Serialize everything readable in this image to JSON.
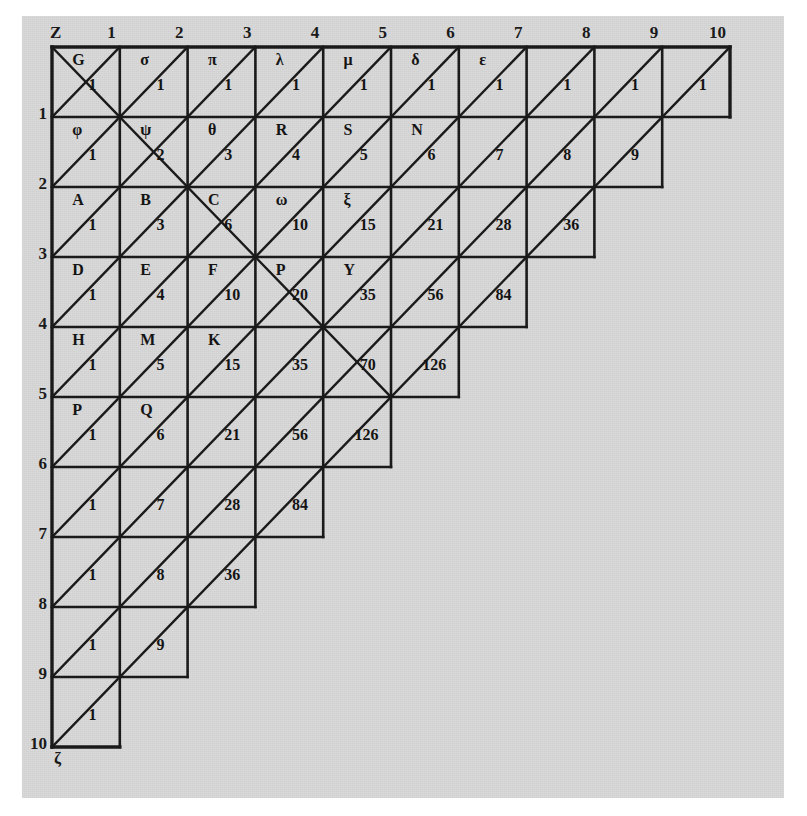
{
  "figure": {
    "kind": "arithmetic-triangle-table",
    "background_color": "#d8d8d8",
    "ink_color": "#1a1a1a",
    "page_color": "#ffffff"
  },
  "axes": {
    "corner_label": "Z",
    "bottom_left_label": "ζ",
    "column_headers": [
      "1",
      "2",
      "3",
      "4",
      "5",
      "6",
      "7",
      "8",
      "9",
      "10"
    ],
    "row_headers": [
      "1",
      "2",
      "3",
      "4",
      "5",
      "6",
      "7",
      "8",
      "9",
      "10"
    ]
  },
  "chart_data": {
    "type": "table",
    "xlabel": "Z",
    "ylabel": "ζ",
    "columns": [
      "1",
      "2",
      "3",
      "4",
      "5",
      "6",
      "7",
      "8",
      "9",
      "10"
    ],
    "rows": [
      "1",
      "2",
      "3",
      "4",
      "5",
      "6",
      "7",
      "8",
      "9",
      "10"
    ],
    "note": "Row r contains cells in columns 1..(11-r). Value at (r,c) = C(r+c-2, c-1).",
    "cells": [
      [
        {
          "letter": "G",
          "value": "1",
          "cross": true
        },
        {
          "letter": "σ",
          "value": "1",
          "cross": false
        },
        {
          "letter": "π",
          "value": "1",
          "cross": false
        },
        {
          "letter": "λ",
          "value": "1",
          "cross": false
        },
        {
          "letter": "μ",
          "value": "1",
          "cross": false
        },
        {
          "letter": "δ",
          "value": "1",
          "cross": false
        },
        {
          "letter": "ε",
          "value": "1",
          "cross": false
        },
        {
          "letter": "",
          "value": "1",
          "cross": false
        },
        {
          "letter": "",
          "value": "1",
          "cross": false
        },
        {
          "letter": "",
          "value": "1",
          "cross": false
        }
      ],
      [
        {
          "letter": "φ",
          "value": "1",
          "cross": false
        },
        {
          "letter": "ψ",
          "value": "2",
          "cross": true
        },
        {
          "letter": "θ",
          "value": "3",
          "cross": false
        },
        {
          "letter": "R",
          "value": "4",
          "cross": false
        },
        {
          "letter": "S",
          "value": "5",
          "cross": false
        },
        {
          "letter": "N",
          "value": "6",
          "cross": false
        },
        {
          "letter": "",
          "value": "7",
          "cross": false
        },
        {
          "letter": "",
          "value": "8",
          "cross": false
        },
        {
          "letter": "",
          "value": "9",
          "cross": false
        }
      ],
      [
        {
          "letter": "A",
          "value": "1",
          "cross": false
        },
        {
          "letter": "B",
          "value": "3",
          "cross": false
        },
        {
          "letter": "C",
          "value": "6",
          "cross": true
        },
        {
          "letter": "ω",
          "value": "10",
          "cross": false
        },
        {
          "letter": "ξ",
          "value": "15",
          "cross": false
        },
        {
          "letter": "",
          "value": "21",
          "cross": false
        },
        {
          "letter": "",
          "value": "28",
          "cross": false
        },
        {
          "letter": "",
          "value": "36",
          "cross": false
        }
      ],
      [
        {
          "letter": "D",
          "value": "1",
          "cross": false
        },
        {
          "letter": "E",
          "value": "4",
          "cross": false
        },
        {
          "letter": "F",
          "value": "10",
          "cross": false
        },
        {
          "letter": "P",
          "value": "20",
          "cross": true
        },
        {
          "letter": "Y",
          "value": "35",
          "cross": false
        },
        {
          "letter": "",
          "value": "56",
          "cross": false
        },
        {
          "letter": "",
          "value": "84",
          "cross": false
        }
      ],
      [
        {
          "letter": "H",
          "value": "1",
          "cross": false
        },
        {
          "letter": "M",
          "value": "5",
          "cross": false
        },
        {
          "letter": "K",
          "value": "15",
          "cross": false
        },
        {
          "letter": "",
          "value": "35",
          "cross": false
        },
        {
          "letter": "",
          "value": "70",
          "cross": true
        },
        {
          "letter": "",
          "value": "126",
          "cross": false
        }
      ],
      [
        {
          "letter": "P",
          "value": "1",
          "cross": false
        },
        {
          "letter": "Q",
          "value": "6",
          "cross": false
        },
        {
          "letter": "",
          "value": "21",
          "cross": false
        },
        {
          "letter": "",
          "value": "56",
          "cross": false
        },
        {
          "letter": "",
          "value": "126",
          "cross": false
        }
      ],
      [
        {
          "letter": "",
          "value": "1",
          "cross": false
        },
        {
          "letter": "",
          "value": "7",
          "cross": false
        },
        {
          "letter": "",
          "value": "28",
          "cross": false
        },
        {
          "letter": "",
          "value": "84",
          "cross": false
        }
      ],
      [
        {
          "letter": "",
          "value": "1",
          "cross": false
        },
        {
          "letter": "",
          "value": "8",
          "cross": false
        },
        {
          "letter": "",
          "value": "36",
          "cross": false
        }
      ],
      [
        {
          "letter": "",
          "value": "1",
          "cross": false
        },
        {
          "letter": "",
          "value": "9",
          "cross": false
        }
      ],
      [
        {
          "letter": "",
          "value": "1",
          "cross": false
        }
      ]
    ]
  },
  "geometry": {
    "origin_x": 30,
    "origin_y": 31,
    "cell_w": 67.8,
    "cell_h": 70.0
  }
}
